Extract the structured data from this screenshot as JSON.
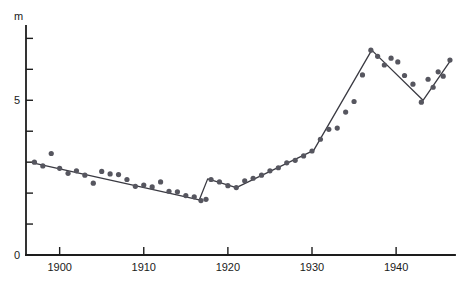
{
  "chart_data": {
    "type": "scatter",
    "title": "",
    "subtitle": "",
    "xlabel": "",
    "ylabel": "m",
    "ylabel_position": "axis-top",
    "xlim": [
      1896,
      1947
    ],
    "ylim": [
      0,
      7.4
    ],
    "grid": false,
    "legend": null,
    "x_ticks": [
      1900,
      1910,
      1920,
      1930,
      1940
    ],
    "x_tick_labels": [
      "1900",
      "1910",
      "1920",
      "1930",
      "1940"
    ],
    "x_minor_tick_interval": 10,
    "y_ticks": [
      0,
      1,
      2,
      3,
      4,
      5,
      6,
      7
    ],
    "y_tick_labels": [
      "0",
      "",
      "",
      "",
      "",
      "5",
      "",
      ""
    ],
    "y_labeled_ticks": [
      {
        "value": 0,
        "label": "0"
      },
      {
        "value": 5,
        "label": "5"
      }
    ],
    "axis_unit_label": "m",
    "series": [
      {
        "name": "observations",
        "kind": "scatter",
        "marker": "circle",
        "color": "#56565f",
        "points": [
          {
            "x": 1897.0,
            "y": 3.0
          },
          {
            "x": 1898.0,
            "y": 2.88
          },
          {
            "x": 1899.0,
            "y": 3.28
          },
          {
            "x": 1900.0,
            "y": 2.8
          },
          {
            "x": 1901.0,
            "y": 2.64
          },
          {
            "x": 1902.0,
            "y": 2.72
          },
          {
            "x": 1903.0,
            "y": 2.58
          },
          {
            "x": 1904.0,
            "y": 2.32
          },
          {
            "x": 1905.0,
            "y": 2.7
          },
          {
            "x": 1906.0,
            "y": 2.62
          },
          {
            "x": 1907.0,
            "y": 2.6
          },
          {
            "x": 1908.0,
            "y": 2.44
          },
          {
            "x": 1909.0,
            "y": 2.22
          },
          {
            "x": 1910.0,
            "y": 2.26
          },
          {
            "x": 1911.0,
            "y": 2.2
          },
          {
            "x": 1912.0,
            "y": 2.36
          },
          {
            "x": 1913.0,
            "y": 2.06
          },
          {
            "x": 1914.0,
            "y": 2.04
          },
          {
            "x": 1915.0,
            "y": 1.92
          },
          {
            "x": 1916.0,
            "y": 1.88
          },
          {
            "x": 1916.8,
            "y": 1.76
          },
          {
            "x": 1917.4,
            "y": 1.8
          },
          {
            "x": 1918.0,
            "y": 2.44
          },
          {
            "x": 1919.0,
            "y": 2.36
          },
          {
            "x": 1920.0,
            "y": 2.24
          },
          {
            "x": 1921.0,
            "y": 2.18
          },
          {
            "x": 1922.0,
            "y": 2.4
          },
          {
            "x": 1923.0,
            "y": 2.48
          },
          {
            "x": 1924.0,
            "y": 2.58
          },
          {
            "x": 1925.0,
            "y": 2.72
          },
          {
            "x": 1926.0,
            "y": 2.82
          },
          {
            "x": 1927.0,
            "y": 2.98
          },
          {
            "x": 1928.0,
            "y": 3.06
          },
          {
            "x": 1929.0,
            "y": 3.2
          },
          {
            "x": 1930.0,
            "y": 3.36
          },
          {
            "x": 1931.0,
            "y": 3.74
          },
          {
            "x": 1932.0,
            "y": 4.06
          },
          {
            "x": 1933.0,
            "y": 4.1
          },
          {
            "x": 1934.0,
            "y": 4.62
          },
          {
            "x": 1935.0,
            "y": 4.96
          },
          {
            "x": 1936.0,
            "y": 5.82
          },
          {
            "x": 1937.0,
            "y": 6.62
          },
          {
            "x": 1937.8,
            "y": 6.42
          },
          {
            "x": 1938.6,
            "y": 6.14
          },
          {
            "x": 1939.4,
            "y": 6.36
          },
          {
            "x": 1940.2,
            "y": 6.24
          },
          {
            "x": 1941.0,
            "y": 5.8
          },
          {
            "x": 1942.0,
            "y": 5.52
          },
          {
            "x": 1943.0,
            "y": 4.94
          },
          {
            "x": 1943.8,
            "y": 5.68
          },
          {
            "x": 1944.4,
            "y": 5.42
          },
          {
            "x": 1945.0,
            "y": 5.92
          },
          {
            "x": 1945.6,
            "y": 5.78
          },
          {
            "x": 1946.4,
            "y": 6.3
          }
        ]
      },
      {
        "name": "fitted-trend",
        "kind": "line",
        "color": "#3a3a42",
        "vertices": [
          {
            "x": 1896.8,
            "y": 2.98
          },
          {
            "x": 1916.6,
            "y": 1.78
          },
          {
            "x": 1917.6,
            "y": 2.46
          },
          {
            "x": 1921.0,
            "y": 2.18
          },
          {
            "x": 1930.2,
            "y": 3.38
          },
          {
            "x": 1937.1,
            "y": 6.62
          },
          {
            "x": 1943.2,
            "y": 5.0
          },
          {
            "x": 1946.5,
            "y": 6.3
          }
        ]
      }
    ]
  }
}
